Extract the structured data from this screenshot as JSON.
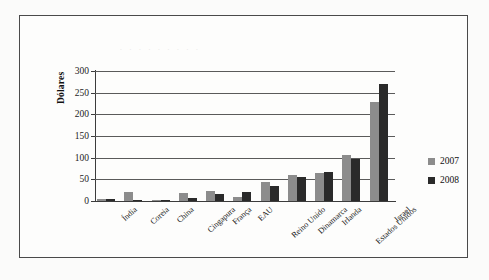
{
  "faint_header": ". .   .   . . . .      . .",
  "legend": {
    "position": "right",
    "entries": [
      {
        "label": "2007",
        "color": "#8c8c8c"
      },
      {
        "label": "2008",
        "color": "#2a2a2a"
      }
    ]
  },
  "chart_data": {
    "type": "bar",
    "title": "",
    "xlabel": "",
    "ylabel": "Dólares",
    "ylim": [
      0,
      300
    ],
    "ytick_step": 50,
    "ytick_labels": [
      "0",
      "50",
      "100",
      "150",
      "200",
      "250",
      "300"
    ],
    "grid": true,
    "categories": [
      "Índia",
      "Coreia",
      "China",
      "Cingapura",
      "França",
      "EAU",
      "Reino Unido",
      "Dinamarca",
      "Irlanda",
      "Estados Unidos",
      "Israel"
    ],
    "series": [
      {
        "name": "2007",
        "color": "#8c8c8c",
        "values": [
          4,
          20,
          3,
          18,
          24,
          10,
          44,
          59,
          64,
          107,
          228
        ]
      },
      {
        "name": "2008",
        "color": "#2a2a2a",
        "values": [
          5,
          3,
          3,
          8,
          17,
          20,
          34,
          55,
          66,
          97,
          271
        ]
      }
    ]
  }
}
